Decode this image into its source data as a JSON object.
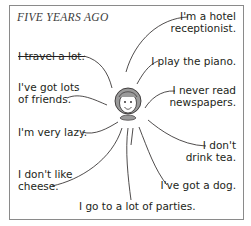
{
  "title": "FIVE YEARS AGO",
  "statements": {
    "travel": "I travel a lot.",
    "friends_1": "I've got lots",
    "friends_2": "of friends.",
    "lazy": "I'm very lazy.",
    "cheese_1": "I don't like",
    "cheese_2": "cheese.",
    "parties": "I go to a lot of parties.",
    "hotel_1": "I'm a hotel",
    "hotel_2": "receptionist.",
    "piano": "I play the piano.",
    "newspapers_1": "I never read",
    "newspapers_2": "newspapers.",
    "tea_1": "I don't",
    "tea_2": "drink tea.",
    "dog": "I've got a dog."
  }
}
